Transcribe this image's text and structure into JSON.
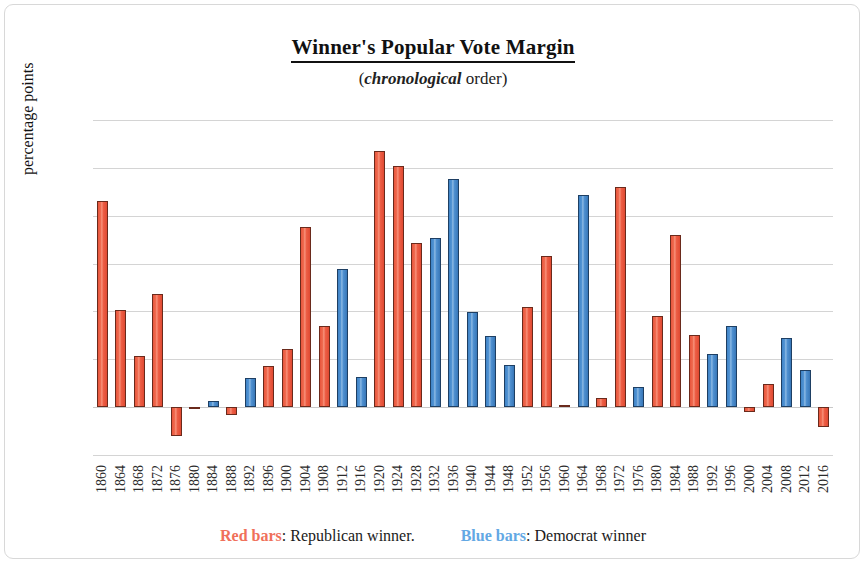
{
  "chart_data": {
    "type": "bar",
    "title": "Winner's Popular Vote Margin",
    "subtitle_italic": "chronological",
    "subtitle_prefix": "(",
    "subtitle_suffix": " order)",
    "xlabel": "",
    "ylabel": "percentage points",
    "ylim": [
      -5,
      30
    ],
    "yticks": [
      30,
      25,
      20,
      15,
      10,
      5,
      0,
      -5
    ],
    "grid": true,
    "legend_position": "bottom",
    "categories": [
      "1860",
      "1864",
      "1868",
      "1872",
      "1876",
      "1880",
      "1884",
      "1888",
      "1892",
      "1896",
      "1900",
      "1904",
      "1908",
      "1912",
      "1916",
      "1920",
      "1924",
      "1928",
      "1932",
      "1936",
      "1940",
      "1944",
      "1948",
      "1952",
      "1956",
      "1960",
      "1964",
      "1968",
      "1972",
      "1976",
      "1980",
      "1984",
      "1988",
      "1992",
      "1996",
      "2000",
      "2004",
      "2008",
      "2012",
      "2016"
    ],
    "values": [
      21.5,
      10.1,
      5.3,
      11.8,
      -3.0,
      -0.1,
      0.6,
      -0.8,
      3.0,
      4.3,
      6.1,
      18.8,
      8.5,
      14.4,
      3.1,
      26.8,
      25.2,
      17.2,
      17.7,
      23.8,
      9.9,
      7.4,
      4.4,
      10.5,
      15.8,
      0.2,
      22.2,
      1.0,
      23.0,
      2.1,
      9.5,
      18.0,
      7.5,
      5.6,
      8.5,
      -0.5,
      2.4,
      7.2,
      3.9,
      -2.1
    ],
    "party": [
      "red",
      "red",
      "red",
      "red",
      "red",
      "red",
      "blue",
      "red",
      "blue",
      "red",
      "red",
      "red",
      "red",
      "blue",
      "blue",
      "red",
      "red",
      "red",
      "blue",
      "blue",
      "blue",
      "blue",
      "blue",
      "red",
      "red",
      "red",
      "blue",
      "red",
      "red",
      "blue",
      "red",
      "red",
      "red",
      "blue",
      "blue",
      "red",
      "red",
      "blue",
      "blue",
      "red"
    ],
    "series": [
      {
        "name": "Republican winner",
        "color": "#ed5e45"
      },
      {
        "name": "Democrat winner",
        "color": "#5193d3"
      }
    ]
  },
  "legend": {
    "red_label": "Red bars",
    "red_sep": ": ",
    "red_text": "Republican winner.",
    "blue_label": "Blue bars",
    "blue_sep": ": ",
    "blue_text": "Democrat winner"
  },
  "colors": {
    "red": "#ed5e45",
    "blue": "#5193d3",
    "grid": "#d4d4d4",
    "border": "#d8d8d8"
  }
}
